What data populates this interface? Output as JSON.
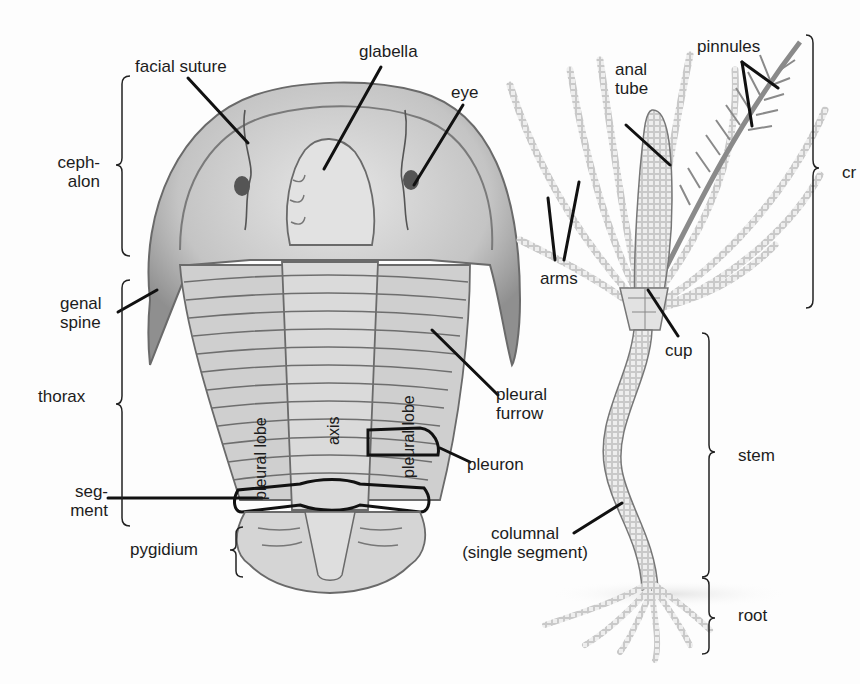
{
  "figure": {
    "left_specimen": "trilobite",
    "right_specimen": "crinoid"
  },
  "trilobite_labels": {
    "facial_suture": "facial suture",
    "glabella": "glabella",
    "eye": "eye",
    "cephalon_1": "ceph-",
    "cephalon_2": "alon",
    "genal_spine_1": "genal",
    "genal_spine_2": "spine",
    "thorax": "thorax",
    "segment_1": "seg-",
    "segment_2": "ment",
    "pygidium": "pygidium",
    "pleural_lobe_left": "pleural lobe",
    "axis": "axis",
    "pleural_lobe_right": "pleural lobe",
    "pleural_furrow_1": "pleural",
    "pleural_furrow_2": "furrow",
    "pleuron": "pleuron"
  },
  "crinoid_labels": {
    "anal_tube_1": "anal",
    "anal_tube_2": "tube",
    "pinnules": "pinnules",
    "arms": "arms",
    "crown_truncated": "cr",
    "cup": "cup",
    "stem": "stem",
    "columnal_1": "columnal",
    "columnal_2": "(single segment)",
    "root": "root"
  },
  "colors": {
    "background": "#fdfdfd",
    "ink": "#1a1a1a",
    "shell_light": "#d9d9d9",
    "shell_mid": "#a8a8a8",
    "shell_dark": "#6e6e6e",
    "crinoid": "#8a8a8a"
  }
}
